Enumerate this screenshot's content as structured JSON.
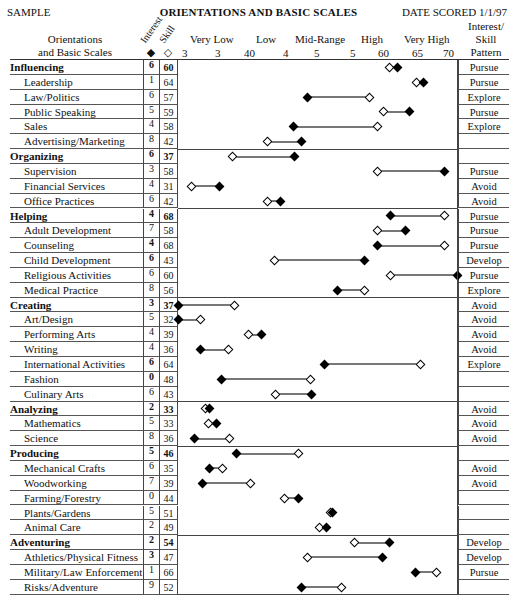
{
  "header": {
    "left": "SAMPLE",
    "title": "ORIENTATIONS AND BASIC SCALES",
    "right": "DATE SCORED 1/1/97"
  },
  "columns": {
    "orientations_line1": "Orientations",
    "orientations_line2": "and Basic Scales",
    "interest": "Interest",
    "skill": "Skill",
    "interest_symbol": "◆",
    "skill_symbol": "◇",
    "pattern_line1": "Interest/",
    "pattern_line2": "Skill",
    "pattern_line3": "Pattern"
  },
  "scale": {
    "bands": [
      "Very Low",
      "Low",
      "Mid-Range",
      "High",
      "Very High"
    ],
    "ticks": [
      "3",
      "3",
      "40",
      "4",
      "5",
      "5",
      "60",
      "65",
      "70"
    ]
  },
  "chart_data": {
    "type": "dumbbell",
    "title": "ORIENTATIONS AND BASIC SCALES",
    "xlabel": "Score range (Very Low → Very High)",
    "ylabel": "Orientations and Basic Scales",
    "legend": [
      {
        "name": "Interest",
        "marker": "filled diamond"
      },
      {
        "name": "Skill",
        "marker": "open diamond"
      }
    ],
    "x_pixel_range": [
      178,
      458
    ],
    "rows": [
      {
        "name": "Influencing",
        "level": "orientation",
        "interest": "6",
        "skill": "60",
        "interest_x": 397,
        "skill_x": 389,
        "pattern": "Pursue"
      },
      {
        "name": "Leadership",
        "level": "scale",
        "interest": "1",
        "skill": "64",
        "interest_x": 423,
        "skill_x": 416,
        "pattern": "Pursue"
      },
      {
        "name": "Law/Politics",
        "level": "scale",
        "interest": "6",
        "skill": "57",
        "interest_x": 307,
        "skill_x": 369,
        "pattern": "Explore"
      },
      {
        "name": "Public Speaking",
        "level": "scale",
        "interest": "5",
        "skill": "59",
        "interest_x": 409,
        "skill_x": 383,
        "pattern": "Pursue"
      },
      {
        "name": "Sales",
        "level": "scale",
        "interest": "4",
        "skill": "58",
        "interest_x": 293,
        "skill_x": 377,
        "pattern": "Explore"
      },
      {
        "name": "Advertising/Marketing",
        "level": "scale",
        "interest": "8",
        "skill": "42",
        "interest_x": 301,
        "skill_x": 267,
        "pattern": ""
      },
      {
        "name": "Organizing",
        "level": "orientation",
        "interest": "6",
        "skill": "37",
        "interest_x": 294,
        "skill_x": 232,
        "pattern": ""
      },
      {
        "name": "Supervision",
        "level": "scale",
        "interest": "3",
        "skill": "58",
        "interest_x": 444,
        "skill_x": 377,
        "pattern": "Pursue"
      },
      {
        "name": "Financial Services",
        "level": "scale",
        "interest": "4",
        "skill": "31",
        "interest_x": 219,
        "skill_x": 191,
        "pattern": "Avoid"
      },
      {
        "name": "Office Practices",
        "level": "scale",
        "interest": "6",
        "skill": "42",
        "interest_x": 280,
        "skill_x": 267,
        "pattern": "Avoid"
      },
      {
        "name": "Helping",
        "level": "orientation",
        "interest": "4",
        "skill": "68",
        "interest_x": 390,
        "skill_x": 444,
        "pattern": "Pursue"
      },
      {
        "name": "Adult Development",
        "level": "scale",
        "interest": "7",
        "skill": "58",
        "interest_x": 405,
        "skill_x": 377,
        "pattern": "Pursue"
      },
      {
        "name": "Counseling",
        "level": "scale",
        "interest": "4",
        "skill": "68",
        "interest_x": 377,
        "skill_x": 444,
        "pattern": "Pursue",
        "interest_bold": true
      },
      {
        "name": "Child Development",
        "level": "scale",
        "interest": "6",
        "skill": "43",
        "interest_x": 364,
        "skill_x": 274,
        "pattern": "Develop",
        "interest_bold": true
      },
      {
        "name": "Religious Activities",
        "level": "scale",
        "interest": "6",
        "skill": "60",
        "interest_x": 457,
        "skill_x": 390,
        "pattern": "Pursue"
      },
      {
        "name": "Medical Practice",
        "level": "scale",
        "interest": "8",
        "skill": "56",
        "interest_x": 337,
        "skill_x": 364,
        "pattern": "Explore"
      },
      {
        "name": "Creating",
        "level": "orientation",
        "interest": "3",
        "skill": "37",
        "interest_x": 178,
        "skill_x": 234,
        "pattern": "Avoid"
      },
      {
        "name": "Art/Design",
        "level": "scale",
        "interest": "5",
        "skill": "32",
        "interest_x": 178,
        "skill_x": 200,
        "pattern": "Avoid"
      },
      {
        "name": "Performing Arts",
        "level": "scale",
        "interest": "4",
        "skill": "39",
        "interest_x": 261,
        "skill_x": 248,
        "pattern": "Avoid"
      },
      {
        "name": "Writing",
        "level": "scale",
        "interest": "4",
        "skill": "36",
        "interest_x": 200,
        "skill_x": 228,
        "pattern": "Avoid"
      },
      {
        "name": "International Activities",
        "level": "scale",
        "interest": "6",
        "skill": "64",
        "interest_x": 324,
        "skill_x": 420,
        "pattern": "Explore",
        "interest_bold": true
      },
      {
        "name": "Fashion",
        "level": "scale",
        "interest": "0",
        "skill": "48",
        "interest_x": 221,
        "skill_x": 310,
        "pattern": "",
        "interest_bold": true
      },
      {
        "name": "Culinary Arts",
        "level": "scale",
        "interest": "6",
        "skill": "43",
        "interest_x": 311,
        "skill_x": 275,
        "pattern": ""
      },
      {
        "name": "Analyzing",
        "level": "orientation",
        "interest": "2",
        "skill": "33",
        "interest_x": 209,
        "skill_x": 205,
        "pattern": "Avoid"
      },
      {
        "name": "Mathematics",
        "level": "scale",
        "interest": "5",
        "skill": "33",
        "interest_x": 216,
        "skill_x": 208,
        "pattern": "Avoid"
      },
      {
        "name": "Science",
        "level": "scale",
        "interest": "8",
        "skill": "36",
        "interest_x": 194,
        "skill_x": 229,
        "pattern": "Avoid"
      },
      {
        "name": "Producing",
        "level": "orientation",
        "interest": "5",
        "skill": "46",
        "interest_x": 236,
        "skill_x": 298,
        "pattern": ""
      },
      {
        "name": "Mechanical Crafts",
        "level": "scale",
        "interest": "6",
        "skill": "35",
        "interest_x": 209,
        "skill_x": 222,
        "pattern": "Avoid"
      },
      {
        "name": "Woodworking",
        "level": "scale",
        "interest": "7",
        "skill": "39",
        "interest_x": 202,
        "skill_x": 250,
        "pattern": "Avoid"
      },
      {
        "name": "Farming/Forestry",
        "level": "scale",
        "interest": "0",
        "skill": "44",
        "interest_x": 298,
        "skill_x": 284,
        "pattern": ""
      },
      {
        "name": "Plants/Gardens",
        "level": "scale",
        "interest": "5",
        "skill": "51",
        "interest_x": 332,
        "skill_x": 330,
        "pattern": ""
      },
      {
        "name": "Animal Care",
        "level": "scale",
        "interest": "2",
        "skill": "49",
        "interest_x": 326,
        "skill_x": 319,
        "pattern": ""
      },
      {
        "name": "Adventuring",
        "level": "orientation",
        "interest": "2",
        "skill": "54",
        "interest_x": 389,
        "skill_x": 354,
        "pattern": "Develop"
      },
      {
        "name": "Athletics/Physical Fitness",
        "level": "scale",
        "interest": "3",
        "skill": "47",
        "interest_x": 382,
        "skill_x": 307,
        "pattern": "Develop",
        "interest_bold": true
      },
      {
        "name": "Military/Law Enforcement",
        "level": "scale",
        "interest": "1",
        "skill": "66",
        "interest_x": 415,
        "skill_x": 436,
        "pattern": "Pursue"
      },
      {
        "name": "Risks/Adventure",
        "level": "scale",
        "interest": "9",
        "skill": "52",
        "interest_x": 301,
        "skill_x": 341,
        "pattern": ""
      }
    ]
  }
}
